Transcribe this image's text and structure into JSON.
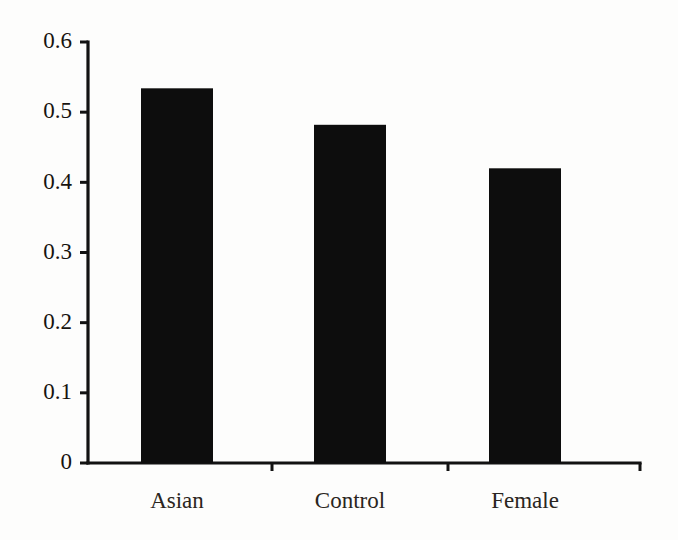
{
  "chart_data": {
    "type": "bar",
    "title": "",
    "subtitle": "",
    "xlabel": "",
    "ylabel": "",
    "categories": [
      "Asian",
      "Control",
      "Female"
    ],
    "values": [
      0.534,
      0.482,
      0.42
    ],
    "series": [
      {
        "name": "",
        "values": [
          0.534,
          0.482,
          0.42
        ]
      }
    ],
    "ylim": [
      0,
      0.6
    ],
    "yticks": [
      0,
      0.1,
      0.2,
      0.3,
      0.4,
      0.5,
      0.6
    ],
    "ytick_labels": [
      "0",
      "0.1",
      "0.2",
      "0.3",
      "0.4",
      "0.5",
      "0.6"
    ],
    "grid": false,
    "legend": false,
    "legend_position": "none",
    "bar_color": "#0d0d0d",
    "axis_color": "#121212",
    "background_color": "#fdfdfc",
    "annotations": []
  },
  "layout": {
    "plot_left": 88,
    "plot_right": 640,
    "plot_top": 42,
    "plot_bottom": 463,
    "tick_length": 8,
    "bar_pixel_boxes": [
      {
        "x": 141,
        "width": 72
      },
      {
        "x": 314,
        "width": 72
      },
      {
        "x": 489,
        "width": 72
      }
    ],
    "category_label_y": 508,
    "separator_tick_x": [
      272,
      448,
      640
    ]
  }
}
